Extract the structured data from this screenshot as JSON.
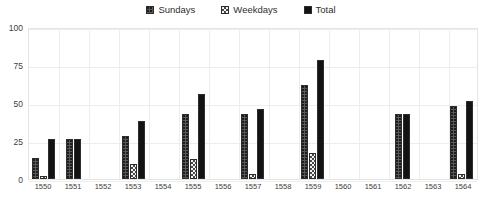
{
  "legend": {
    "position": "top-center",
    "items": [
      {
        "label": "Sundays",
        "swatch": "dark-dotted-swatch"
      },
      {
        "label": "Weekdays",
        "swatch": "light-checkered-swatch"
      },
      {
        "label": "Total",
        "swatch": "solid-black-swatch"
      }
    ]
  },
  "colors": {
    "sundays": "#595959",
    "weekdays": "#f2f2f2",
    "total": "#131313",
    "gridline": "#ededed",
    "axis_text": "#404040",
    "background": "#ffffff"
  },
  "axis": {
    "y_ticks": [
      "0",
      "25",
      "50",
      "75",
      "100"
    ],
    "x_title": "",
    "y_title": ""
  },
  "chart_data": {
    "type": "bar",
    "title": "",
    "subtitle": "",
    "xlabel": "",
    "ylabel": "",
    "ylim": [
      0,
      100
    ],
    "ytick_values": [
      0,
      25,
      50,
      75,
      100
    ],
    "grid": true,
    "legend_position": "top-center",
    "categories": [
      "1550",
      "1551",
      "1552",
      "1553",
      "1554",
      "1555",
      "1556",
      "1557",
      "1558",
      "1559",
      "1560",
      "1561",
      "1562",
      "1563",
      "1564"
    ],
    "series": [
      {
        "name": "Sundays",
        "values": [
          14,
          26,
          0,
          28,
          0,
          43,
          0,
          43,
          0,
          62,
          0,
          0,
          43,
          0,
          48
        ]
      },
      {
        "name": "Weekdays",
        "values": [
          2,
          0,
          0,
          10,
          0,
          13,
          0,
          3,
          0,
          17,
          0,
          0,
          0,
          0,
          3
        ]
      },
      {
        "name": "Total",
        "values": [
          26,
          26,
          0,
          38,
          0,
          56,
          0,
          46,
          0,
          78,
          0,
          0,
          43,
          0,
          51
        ]
      }
    ]
  }
}
